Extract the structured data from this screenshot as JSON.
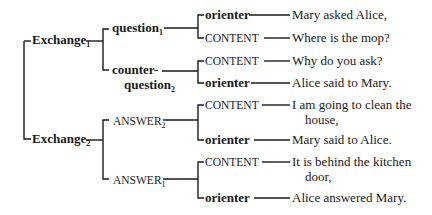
{
  "diagram": {
    "type": "tree",
    "root_nodes": [
      {
        "label": "Exchange",
        "subscript": "1"
      },
      {
        "label": "Exchange",
        "subscript": "2"
      }
    ],
    "exchange1": {
      "label": "Exchange",
      "sub": "1",
      "children": [
        {
          "label": "question",
          "sub": "1",
          "children": [
            {
              "role": "orienter",
              "text": "Mary asked Alice,"
            },
            {
              "role": "CONTENT",
              "text": "Where is the mop?"
            }
          ]
        },
        {
          "label_line1": "counter-",
          "label_line2": "question",
          "sub": "2",
          "children": [
            {
              "role": "CONTENT",
              "text": "Why do you ask?"
            },
            {
              "role": "orienter",
              "text": "Alice said to Mary."
            }
          ]
        }
      ]
    },
    "exchange2": {
      "label": "Exchange",
      "sub": "2",
      "children": [
        {
          "label": "ANSWER",
          "sub": "2",
          "children": [
            {
              "role": "CONTENT",
              "text_line1": "I am going to clean the",
              "text_line2": "house,"
            },
            {
              "role": "orienter",
              "text": "Mary said to Alice."
            }
          ]
        },
        {
          "label": "ANSWER",
          "sub": "1",
          "children": [
            {
              "role": "CONTENT",
              "text_line1": "It is behind the kitchen",
              "text_line2": "door,"
            },
            {
              "role": "orienter",
              "text": "Alice answered Mary."
            }
          ]
        }
      ]
    }
  }
}
